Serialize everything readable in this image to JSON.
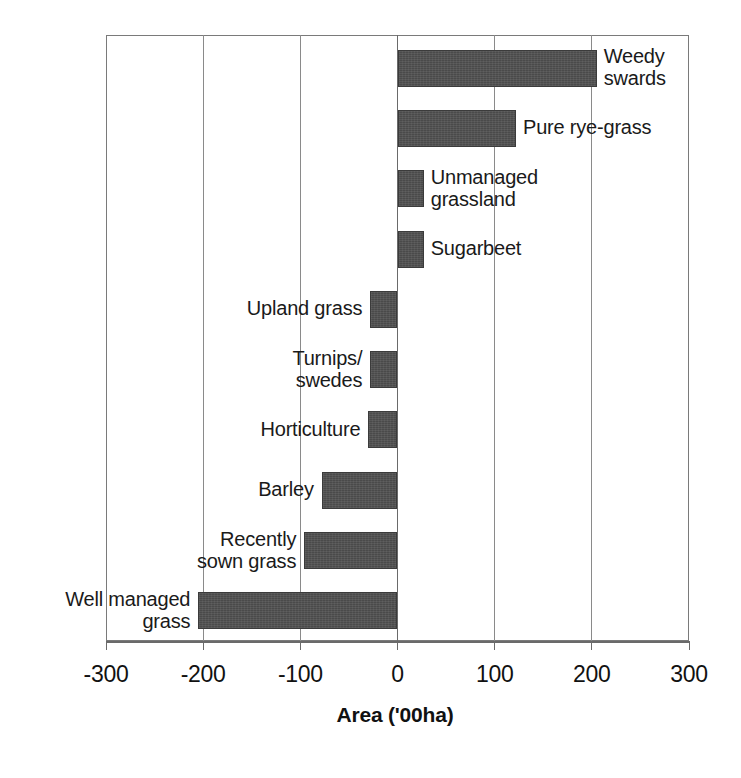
{
  "chart_data": {
    "type": "bar",
    "orientation": "horizontal",
    "title": "",
    "xlabel": "Area ('00ha)",
    "ylabel": "",
    "xlim": [
      -300,
      300
    ],
    "xticks": [
      -300,
      -200,
      -100,
      0,
      100,
      200,
      300
    ],
    "xtick_labels": [
      "-300",
      "-200",
      "-100",
      "0",
      "100",
      "200",
      "300"
    ],
    "grid": true,
    "grid_axis": "x",
    "legend": "none",
    "bar_color": "#4a4a4a",
    "categories": [
      "Weedy swards",
      "Pure rye-grass",
      "Unmanaged grassland",
      "Sugarbeet",
      "Upland grass",
      "Turnips/ swedes",
      "Horticulture",
      "Barley",
      "Recently sown grass",
      "Well managed grass"
    ],
    "values": [
      205,
      122,
      27,
      27,
      -28,
      -28,
      -30,
      -78,
      -96,
      -205
    ],
    "bars": [
      {
        "label": "Weedy\nswards",
        "value": 205,
        "label_side": "right"
      },
      {
        "label": "Pure rye-grass",
        "value": 122,
        "label_side": "right"
      },
      {
        "label": "Unmanaged\ngrassland",
        "value": 27,
        "label_side": "right"
      },
      {
        "label": "Sugarbeet",
        "value": 27,
        "label_side": "right"
      },
      {
        "label": "Upland grass",
        "value": -28,
        "label_side": "left"
      },
      {
        "label": "Turnips/\nswedes",
        "value": -28,
        "label_side": "left"
      },
      {
        "label": "Horticulture",
        "value": -30,
        "label_side": "left"
      },
      {
        "label": "Barley",
        "value": -78,
        "label_side": "left"
      },
      {
        "label": "Recently\nsown grass",
        "value": -96,
        "label_side": "left"
      },
      {
        "label": "Well managed\ngrass",
        "value": -205,
        "label_side": "left"
      }
    ]
  },
  "axis": {
    "title": "Area ('00ha)",
    "tick_labels": [
      "-300",
      "-200",
      "-100",
      "0",
      "100",
      "200",
      "300"
    ]
  }
}
